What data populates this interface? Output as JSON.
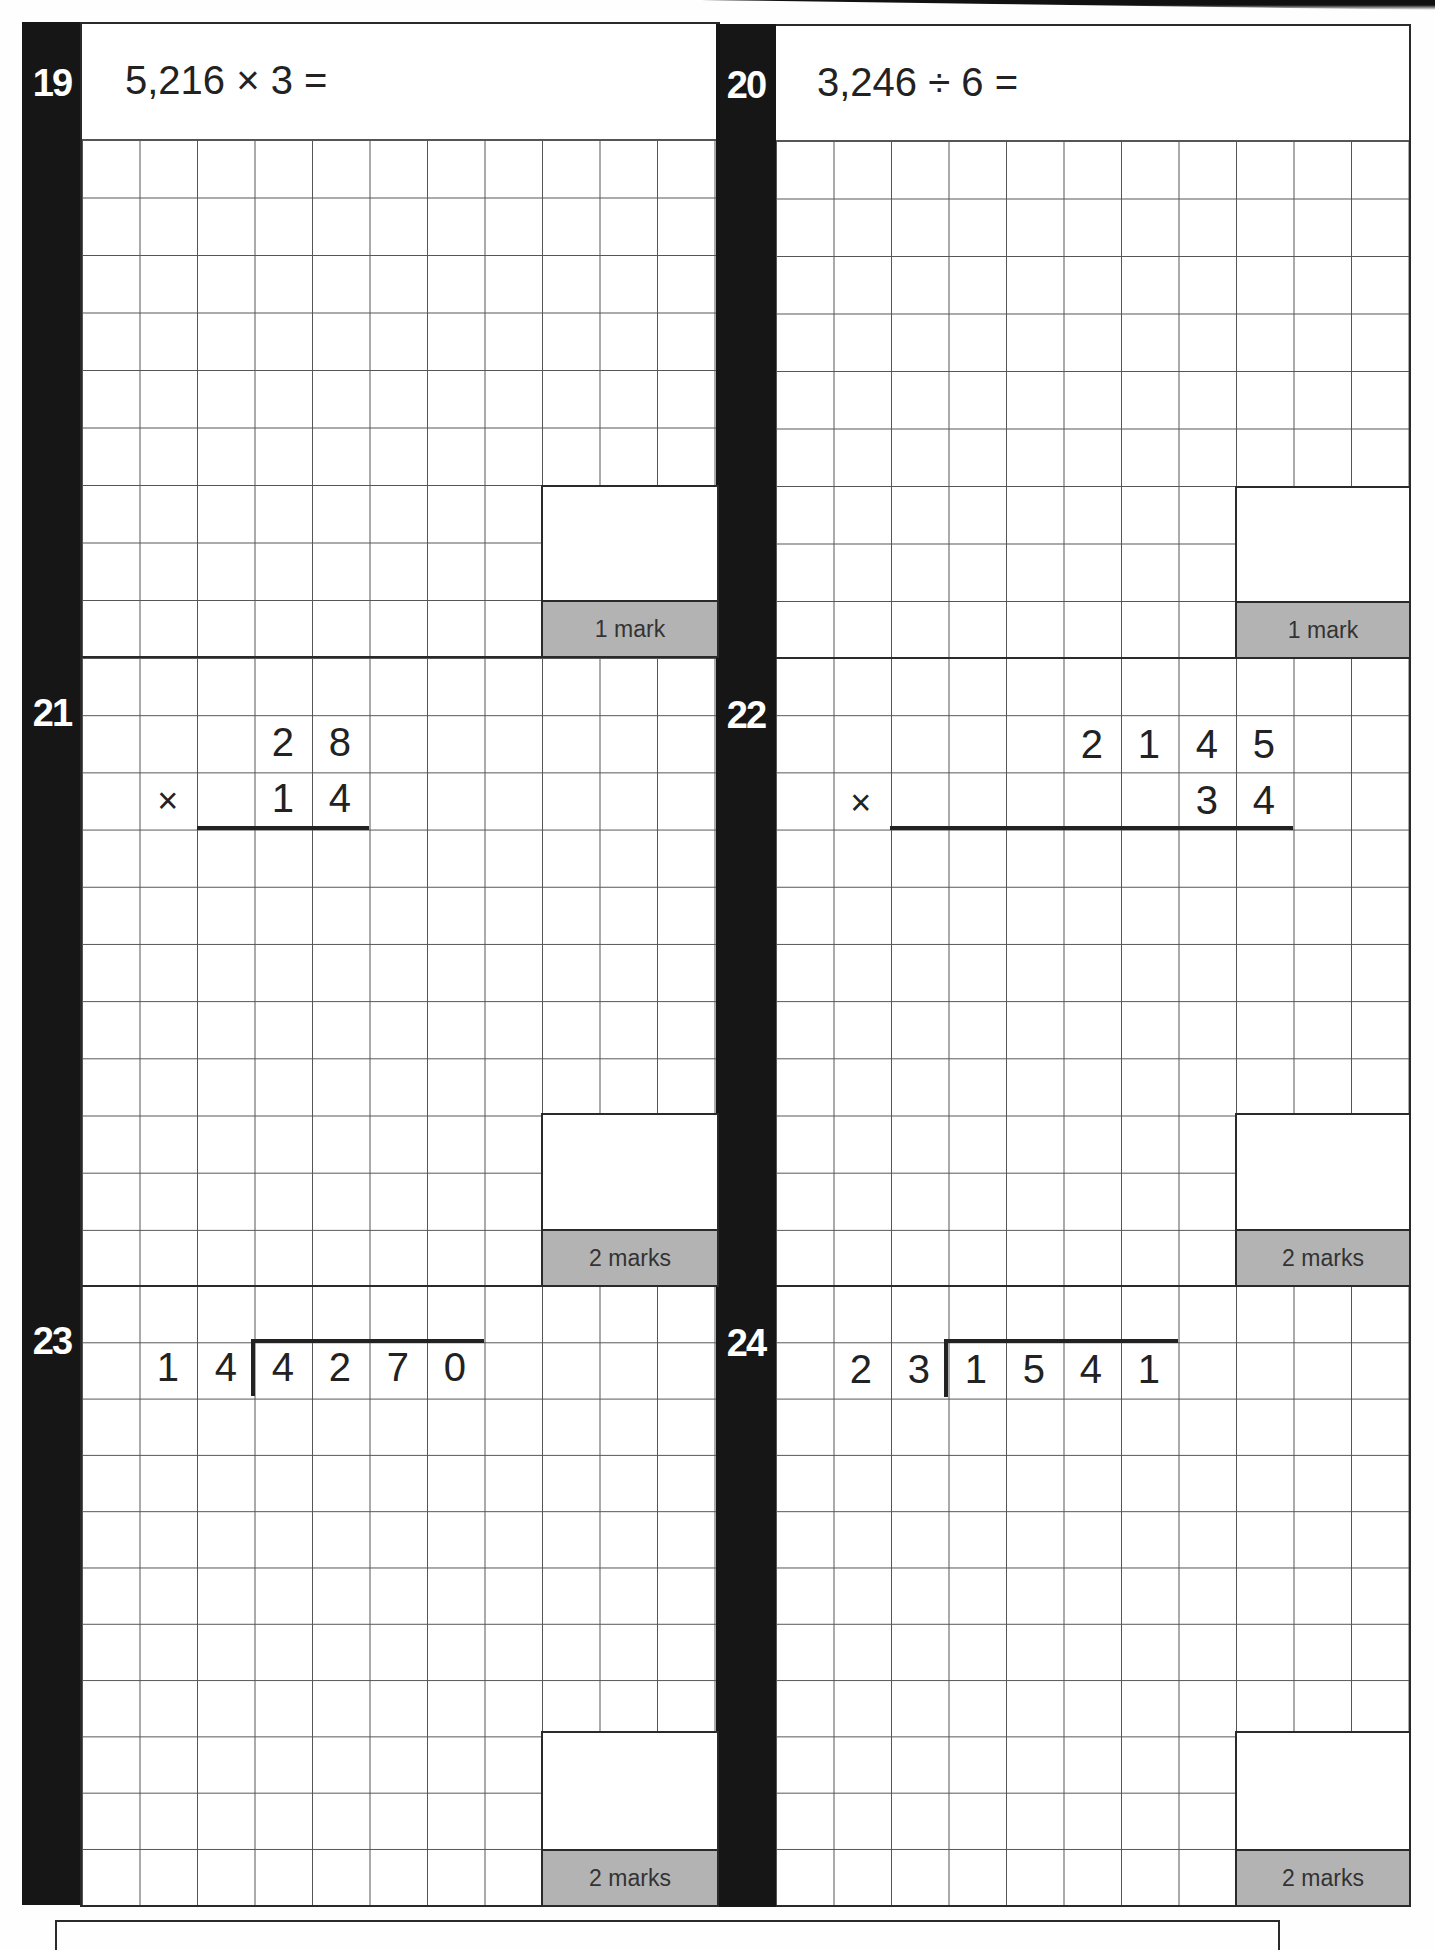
{
  "questions": [
    {
      "number": "19",
      "prompt": "5,216 × 3 =",
      "marks": "1 mark"
    },
    {
      "number": "20",
      "prompt": "3,246 ÷ 6 =",
      "marks": "1 mark"
    },
    {
      "number": "21",
      "operator": "×",
      "row1": [
        "2",
        "8"
      ],
      "row2": [
        "1",
        "4"
      ],
      "marks": "2 marks"
    },
    {
      "number": "22",
      "operator": "×",
      "row1": [
        "2",
        "1",
        "4",
        "5"
      ],
      "row2": [
        "3",
        "4"
      ],
      "marks": "2 marks"
    },
    {
      "number": "23",
      "divisor": [
        "1",
        "4"
      ],
      "dividend": [
        "4",
        "2",
        "7",
        "0"
      ],
      "marks": "2 marks"
    },
    {
      "number": "24",
      "divisor": [
        "2",
        "3"
      ],
      "dividend": [
        "1",
        "5",
        "4",
        "1"
      ],
      "marks": "2 marks"
    }
  ]
}
